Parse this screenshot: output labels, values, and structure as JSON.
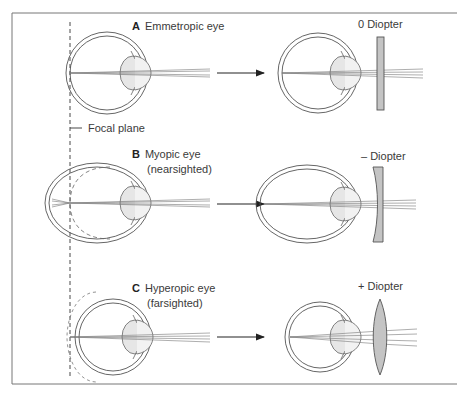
{
  "figure": {
    "focal_plane_label": "Focal plane",
    "panels": [
      {
        "letter": "A",
        "title": "Emmetropic eye",
        "subtitle": "",
        "lens_label": "0 Diopter",
        "lens_type": "flat"
      },
      {
        "letter": "B",
        "title": "Myopic eye",
        "subtitle": "(nearsighted)",
        "lens_label": "– Diopter",
        "lens_type": "concave"
      },
      {
        "letter": "C",
        "title": "Hyperopic eye",
        "subtitle": "(farsighted)",
        "lens_label": "+ Diopter",
        "lens_type": "convex"
      }
    ]
  },
  "colors": {
    "line": "#555555",
    "lens_fill": "#c4c4c4",
    "eye_lens_fill": "#e6e6e6",
    "border": "#777777"
  }
}
